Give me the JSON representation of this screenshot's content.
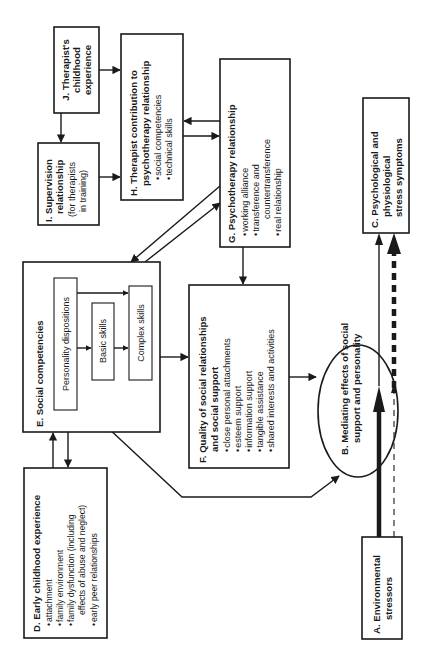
{
  "diagram": {
    "orientation": "rotated 90 degrees counter-clockwise",
    "nodes": {
      "A": {
        "title_lines": [
          "A. Environmental",
          "stressors"
        ],
        "items": []
      },
      "B": {
        "title_lines": [
          "B. Mediating effects of social",
          "support and personality"
        ],
        "items": []
      },
      "C": {
        "title_lines": [
          "C. Psychological and",
          "physiological",
          "stress symptoms"
        ],
        "items": []
      },
      "D": {
        "title_lines": [
          "D. Early childhood experience"
        ],
        "items": [
          "attachment",
          "family environment",
          "family dysfunction (including",
          "effects of abuse and neglect)",
          "early peer relationships"
        ]
      },
      "E": {
        "title_lines": [
          "E. Social competencies"
        ],
        "inner": {
          "personality": "Personality dispositions",
          "basic": "Basic skills",
          "complex": "Complex skills"
        }
      },
      "F": {
        "title_lines": [
          "F. Quality of social relationships",
          "and social support"
        ],
        "items": [
          "close personal attachments",
          "esteem support",
          "information support",
          "tangible assistance",
          "shared interests and activities"
        ]
      },
      "G": {
        "title_lines": [
          "G. Psychotherapy relationship"
        ],
        "items": [
          "working alliance",
          "transference and",
          "countertransference",
          "real relationship"
        ]
      },
      "H": {
        "title_lines": [
          "H. Therapist contribution to",
          "psychotherapy relationship"
        ],
        "items": [
          "social competencies",
          "technical skills"
        ]
      },
      "I": {
        "title_lines": [
          "I. Supervision",
          "relationship"
        ],
        "sub_lines": [
          "(for therapists",
          "in training)"
        ]
      },
      "J": {
        "title_lines": [
          "J. Therapist's",
          "childhood",
          "experience"
        ]
      }
    },
    "bullet": "•",
    "edges": [
      {
        "from": "J",
        "to": "H",
        "style": "solid"
      },
      {
        "from": "J",
        "to": "I",
        "style": "solid"
      },
      {
        "from": "I",
        "to": "H",
        "style": "solid"
      },
      {
        "from": "H",
        "to": "G",
        "style": "solid"
      },
      {
        "from": "G",
        "to": "H",
        "style": "solid"
      },
      {
        "from": "G",
        "to": "E",
        "style": "solid"
      },
      {
        "from": "E",
        "to": "G",
        "style": "solid"
      },
      {
        "from": "G",
        "to": "F",
        "style": "solid"
      },
      {
        "from": "E",
        "to": "F",
        "style": "solid"
      },
      {
        "from": "D",
        "to": "E",
        "style": "solid"
      },
      {
        "from": "E",
        "to": "D",
        "style": "solid"
      },
      {
        "from": "E",
        "to": "B",
        "style": "solid"
      },
      {
        "from": "F",
        "to": "B",
        "style": "solid"
      },
      {
        "from": "A",
        "to": "B",
        "style": "thick"
      },
      {
        "from": "A",
        "to": "B",
        "style": "thin-dashed"
      },
      {
        "from": "B",
        "to": "C",
        "style": "thin"
      },
      {
        "from": "B",
        "to": "C",
        "style": "thick-dashed"
      }
    ]
  }
}
